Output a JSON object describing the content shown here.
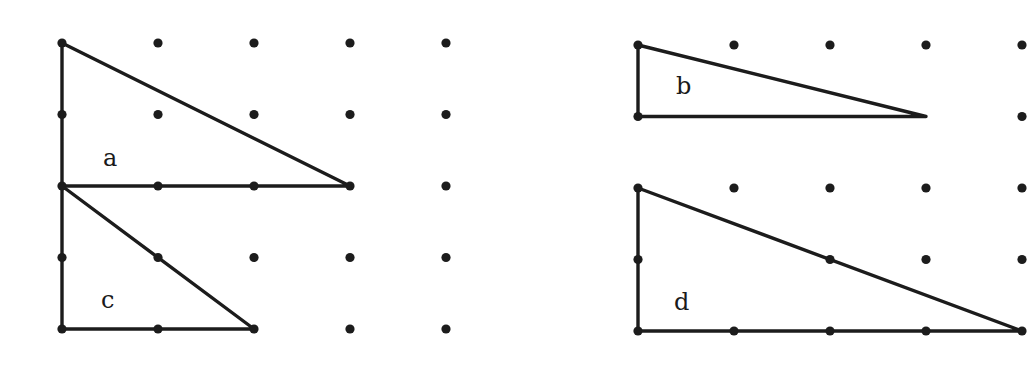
{
  "figure": {
    "colors": {
      "ink": "#1c1c1c",
      "background": "#ffffff"
    },
    "spacing": {
      "dx": 96,
      "dy": 71.5
    },
    "grids": [
      {
        "id": "left",
        "origin": [
          62,
          43
        ],
        "cols": 5,
        "rows": 5,
        "missing": []
      },
      {
        "id": "right",
        "origin": [
          638,
          45
        ],
        "cols": 5,
        "rows": 5,
        "missing": [
          [
            1,
            1
          ],
          [
            2,
            1
          ],
          [
            3,
            1
          ],
          [
            1,
            3
          ]
        ]
      }
    ],
    "triangles": [
      {
        "label": "a",
        "grid": "left",
        "points": [
          [
            0,
            0
          ],
          [
            0,
            2
          ],
          [
            3,
            2
          ]
        ],
        "label_pos": [
          103,
          146
        ]
      },
      {
        "label": "c",
        "grid": "left",
        "points": [
          [
            0,
            2
          ],
          [
            0,
            4
          ],
          [
            2,
            4
          ]
        ],
        "label_pos": [
          101,
          288
        ]
      },
      {
        "label": "b",
        "grid": "right",
        "points": [
          [
            0,
            0
          ],
          [
            0,
            1
          ],
          [
            3,
            1
          ]
        ],
        "label_pos": [
          676,
          74
        ]
      },
      {
        "label": "d",
        "grid": "right",
        "points": [
          [
            0,
            2
          ],
          [
            0,
            4
          ],
          [
            4,
            4
          ]
        ],
        "label_pos": [
          674,
          290
        ]
      }
    ]
  },
  "labels": {
    "a": "a",
    "b": "b",
    "c": "c",
    "d": "d"
  }
}
